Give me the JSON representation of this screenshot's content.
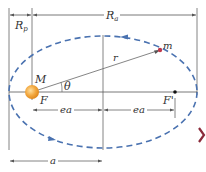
{
  "diagram": {
    "labels": {
      "perihelion_distance": "R",
      "perihelion_sub": "p",
      "aphelion_distance": "R",
      "aphelion_sub": "a",
      "orbiting_mass": "m",
      "central_mass": "M",
      "focus": "F",
      "empty_focus": "F'",
      "radius": "r",
      "angle": "θ",
      "focal_offset_left": "ea",
      "focal_offset_right": "ea",
      "semi_major_axis": "a"
    },
    "colors": {
      "orbit": "#4a72b0",
      "lines": "#555555",
      "sun": "#f0a640",
      "planet": "#c0394b",
      "chevron": "#8a2a3a"
    }
  }
}
